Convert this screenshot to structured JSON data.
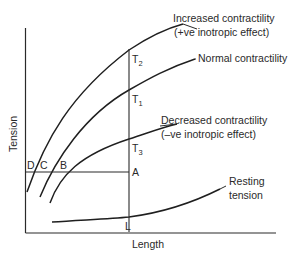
{
  "diagram": {
    "axes": {
      "x_label": "Length",
      "y_label": "Tension"
    },
    "curves": [
      {
        "id": "increased",
        "label_line1": "Increased contractility",
        "label_line2": "(+ve inotropic effect)"
      },
      {
        "id": "normal",
        "label_line1": "Normal contractility"
      },
      {
        "id": "decreased",
        "label_line1": "Decreased contractility",
        "label_line2": "(–ve inotropic effect)"
      },
      {
        "id": "resting",
        "label_line1": "Resting",
        "label_line2": "tension"
      }
    ],
    "points": {
      "T2": {
        "letter": "T",
        "sub": "2"
      },
      "T1": {
        "letter": "T",
        "sub": "1"
      },
      "T3": {
        "letter": "T",
        "sub": "3"
      },
      "A": "A",
      "B": "B",
      "C": "C",
      "D": "D",
      "L": "L"
    }
  }
}
